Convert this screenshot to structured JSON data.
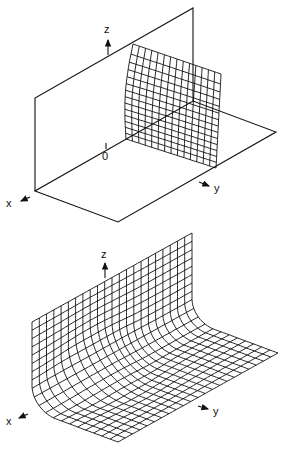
{
  "figures": [
    {
      "name": "top-figure",
      "description": "Two perpendicular planes (vertical wall and floor) with a small curved mesh patch near the origin",
      "axes": {
        "x_label": "x",
        "y_label": "y",
        "z_label": "z",
        "origin_label": "0"
      }
    },
    {
      "name": "bottom-figure",
      "description": "Mesh surface forming an L-shaped wall and floor with a smooth fillet along the corner",
      "axes": {
        "x_label": "x",
        "y_label": "y",
        "z_label": "z"
      }
    }
  ],
  "colors": {
    "ink": "#111111",
    "background": "#ffffff"
  }
}
